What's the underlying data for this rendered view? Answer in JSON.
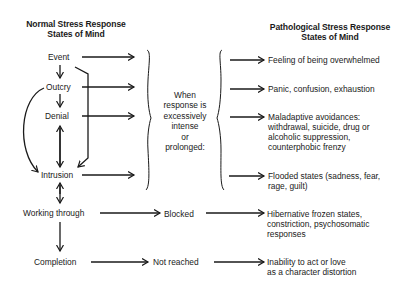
{
  "diagram": {
    "left_header": {
      "line1": "Normal Stress Response",
      "line2": "States of Mind"
    },
    "right_header": {
      "line1": "Pathological Stress Response",
      "line2": "States of Mind"
    },
    "normal_states": [
      {
        "label": "Event"
      },
      {
        "label": "Outcry"
      },
      {
        "label": "Denial"
      },
      {
        "label": "Intrusion"
      },
      {
        "label": "Working through"
      },
      {
        "label": "Completion"
      }
    ],
    "condition": {
      "lines": [
        "When",
        "response is",
        "excessively",
        "intense",
        "or",
        "prolonged:"
      ]
    },
    "intermediate": {
      "working_through": "Blocked",
      "completion": "Not reached"
    },
    "pathological_states": [
      {
        "lines": [
          "Feeling of being overwhelmed"
        ]
      },
      {
        "lines": [
          "Panic, confusion, exhaustion"
        ]
      },
      {
        "lines": [
          "Maladaptive avoidances:",
          "withdrawal, suicide, drug or",
          "alcoholic suppression,",
          "counterphobic  frenzy"
        ]
      },
      {
        "lines": [
          "Flooded states (sadness, fear,",
          "rage, guilt)"
        ]
      },
      {
        "lines": [
          "Hibernative frozen states,",
          "constriction, psychosomatic",
          "responses"
        ]
      },
      {
        "lines": [
          "Inability to act or love",
          "as a character distortion"
        ]
      }
    ],
    "colors": {
      "ink": "#1a1a1a",
      "background": "#ffffff"
    }
  }
}
